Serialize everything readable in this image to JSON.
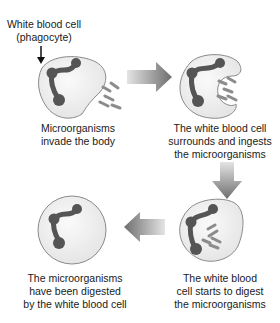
{
  "diagram": {
    "type": "process-cycle",
    "callout": {
      "line1": "White blood cell",
      "line2": "(phagocyte)"
    },
    "steps": [
      {
        "id": 1,
        "position": "top-left",
        "caption_lines": [
          "Microorganisms",
          "invade the body"
        ]
      },
      {
        "id": 2,
        "position": "top-right",
        "caption_lines": [
          "The white blood cell",
          "surrounds and ingests",
          "the microorganisms"
        ]
      },
      {
        "id": 3,
        "position": "bottom-right",
        "caption_lines": [
          "The white blood",
          "cell starts to digest",
          "the microorganisms"
        ]
      },
      {
        "id": 4,
        "position": "bottom-left",
        "caption_lines": [
          "The microorganisms",
          "have been digested",
          "by the white blood cell"
        ]
      }
    ],
    "arrows": [
      {
        "from": 1,
        "to": 2,
        "direction": "right"
      },
      {
        "from": 2,
        "to": 3,
        "direction": "down"
      },
      {
        "from": 3,
        "to": 4,
        "direction": "left"
      }
    ],
    "colors": {
      "cell_fill": "#ececec",
      "cell_stroke": "#8a8a8a",
      "nucleus": "#555555",
      "microorganism": "#8c8c8c",
      "arrow": "#7a7a7a",
      "text": "#1a1a1a"
    }
  }
}
